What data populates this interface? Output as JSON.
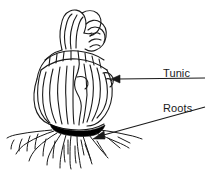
{
  "figure": {
    "background_color": "#ffffff",
    "ink_color": "#1a1a1a",
    "fill_color": "#000000",
    "width": 215,
    "height": 192
  },
  "labels": [
    {
      "id": "tunic",
      "text": "Tunic",
      "x": 163,
      "y": 67,
      "leader": {
        "type": "arrow",
        "from_x": 205,
        "from_y": 78,
        "to_x": 112,
        "to_y": 79
      }
    },
    {
      "id": "roots",
      "text": "Roots",
      "x": 163,
      "y": 102,
      "leader": {
        "type": "arrow",
        "from_x": 205,
        "from_y": 107,
        "to_x": 93,
        "to_y": 139
      }
    }
  ],
  "parts": [
    {
      "id": "shoot-tip",
      "name": "shoot tip"
    },
    {
      "id": "tunic-scales",
      "name": "tunic scales"
    },
    {
      "id": "basal-plate",
      "name": "basal plate"
    },
    {
      "id": "root-fibers",
      "name": "root fibers"
    }
  ]
}
